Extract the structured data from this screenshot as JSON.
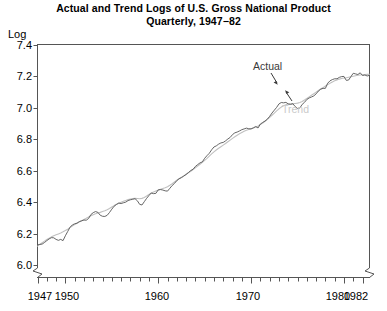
{
  "chart_data": {
    "type": "line",
    "title": "Actual and Trend Logs of U.S. Gross National Product",
    "subtitle": "Quarterly, 1947−82",
    "xlabel": "",
    "ylabel": "Log",
    "ylim": [
      6.0,
      7.4
    ],
    "xlim": [
      1947,
      1982.75
    ],
    "grid": false,
    "legend_position": "inline-annotations",
    "y_ticks": [
      "7.4",
      "7.2",
      "7.0",
      "6.8",
      "6.6",
      "6.4",
      "6.2",
      "6.0"
    ],
    "y_tick_values": [
      7.4,
      7.2,
      7.0,
      6.8,
      6.6,
      6.4,
      6.2,
      6.0
    ],
    "x_ticks_labeled": [
      "1947",
      "1950",
      "1960",
      "1970",
      "1980",
      "1982"
    ],
    "x_tick_values_labeled": [
      1947,
      1950,
      1960,
      1970,
      1980,
      1982
    ],
    "x_minor_tick_interval_years": 1,
    "axis_break_marks": [
      "x-axis-left-origin",
      "x-axis-right-end"
    ],
    "annotations": [
      {
        "text": "Actual",
        "x": 1972.2,
        "y": 7.24,
        "color": "#3a3a3a",
        "arrow_to": {
          "x": 1973.6,
          "y": 7.12
        }
      },
      {
        "text": "Trend",
        "x": 1975.0,
        "y": 6.93,
        "color": "#c9c9c9",
        "arrow_to": {
          "x": 1974.0,
          "y": 7.05
        }
      }
    ],
    "x": [
      1947.0,
      1947.25,
      1947.5,
      1947.75,
      1948.0,
      1948.25,
      1948.5,
      1948.75,
      1949.0,
      1949.25,
      1949.5,
      1949.75,
      1950.0,
      1950.25,
      1950.5,
      1950.75,
      1951.0,
      1951.25,
      1951.5,
      1951.75,
      1952.0,
      1952.25,
      1952.5,
      1952.75,
      1953.0,
      1953.25,
      1953.5,
      1953.75,
      1954.0,
      1954.25,
      1954.5,
      1954.75,
      1955.0,
      1955.25,
      1955.5,
      1955.75,
      1956.0,
      1956.25,
      1956.5,
      1956.75,
      1957.0,
      1957.25,
      1957.5,
      1957.75,
      1958.0,
      1958.25,
      1958.5,
      1958.75,
      1959.0,
      1959.25,
      1959.5,
      1959.75,
      1960.0,
      1960.25,
      1960.5,
      1960.75,
      1961.0,
      1961.25,
      1961.5,
      1961.75,
      1962.0,
      1962.25,
      1962.5,
      1962.75,
      1963.0,
      1963.25,
      1963.5,
      1963.75,
      1964.0,
      1964.25,
      1964.5,
      1964.75,
      1965.0,
      1965.25,
      1965.5,
      1965.75,
      1966.0,
      1966.25,
      1966.5,
      1966.75,
      1967.0,
      1967.25,
      1967.5,
      1967.75,
      1968.0,
      1968.25,
      1968.5,
      1968.75,
      1969.0,
      1969.25,
      1969.5,
      1969.75,
      1970.0,
      1970.25,
      1970.5,
      1970.75,
      1971.0,
      1971.25,
      1971.5,
      1971.75,
      1972.0,
      1972.25,
      1972.5,
      1972.75,
      1973.0,
      1973.25,
      1973.5,
      1973.75,
      1974.0,
      1974.25,
      1974.5,
      1974.75,
      1975.0,
      1975.25,
      1975.5,
      1975.75,
      1976.0,
      1976.25,
      1976.5,
      1976.75,
      1977.0,
      1977.25,
      1977.5,
      1977.75,
      1978.0,
      1978.25,
      1978.5,
      1978.75,
      1979.0,
      1979.25,
      1979.5,
      1979.75,
      1980.0,
      1980.25,
      1980.5,
      1980.75,
      1981.0,
      1981.25,
      1981.5,
      1981.75,
      1982.0,
      1982.25,
      1982.5,
      1982.75
    ],
    "series": [
      {
        "name": "Actual",
        "color": "#555555",
        "width": 0.9,
        "values": [
          6.128,
          6.131,
          6.133,
          6.143,
          6.155,
          6.166,
          6.174,
          6.173,
          6.163,
          6.157,
          6.163,
          6.155,
          6.186,
          6.213,
          6.24,
          6.255,
          6.262,
          6.266,
          6.276,
          6.281,
          6.286,
          6.285,
          6.296,
          6.321,
          6.333,
          6.34,
          6.335,
          6.317,
          6.31,
          6.309,
          6.316,
          6.334,
          6.355,
          6.374,
          6.385,
          6.394,
          6.391,
          6.396,
          6.4,
          6.41,
          6.415,
          6.418,
          6.422,
          6.409,
          6.386,
          6.382,
          6.403,
          6.424,
          6.442,
          6.458,
          6.454,
          6.456,
          6.478,
          6.48,
          6.477,
          6.472,
          6.47,
          6.488,
          6.506,
          6.519,
          6.537,
          6.549,
          6.556,
          6.566,
          6.576,
          6.588,
          6.601,
          6.609,
          6.627,
          6.639,
          6.65,
          6.656,
          6.679,
          6.696,
          6.711,
          6.733,
          6.751,
          6.758,
          6.769,
          6.777,
          6.78,
          6.79,
          6.802,
          6.812,
          6.83,
          6.841,
          6.846,
          6.853,
          6.861,
          6.866,
          6.871,
          6.867,
          6.866,
          6.873,
          6.881,
          6.872,
          6.897,
          6.907,
          6.916,
          6.928,
          6.946,
          6.967,
          6.985,
          7.003,
          7.025,
          7.034,
          7.032,
          7.035,
          7.025,
          7.022,
          7.026,
          7.008,
          6.996,
          6.999,
          7.022,
          7.035,
          7.053,
          7.063,
          7.069,
          7.076,
          7.089,
          7.107,
          7.119,
          7.124,
          7.124,
          7.157,
          7.172,
          7.18,
          7.185,
          7.185,
          7.194,
          7.199,
          7.2,
          7.175,
          7.177,
          7.199,
          7.22,
          7.216,
          7.212,
          7.223,
          7.206,
          7.209,
          7.203,
          7.207
        ]
      },
      {
        "name": "Trend",
        "color": "#c0c0c0",
        "width": 1.1,
        "values": [
          6.12,
          6.131,
          6.142,
          6.152,
          6.162,
          6.171,
          6.179,
          6.186,
          6.192,
          6.198,
          6.204,
          6.211,
          6.219,
          6.228,
          6.238,
          6.248,
          6.257,
          6.266,
          6.274,
          6.282,
          6.29,
          6.297,
          6.305,
          6.313,
          6.32,
          6.326,
          6.331,
          6.335,
          6.34,
          6.345,
          6.352,
          6.36,
          6.369,
          6.378,
          6.386,
          6.393,
          6.399,
          6.405,
          6.411,
          6.416,
          6.42,
          6.423,
          6.424,
          6.423,
          6.422,
          6.424,
          6.43,
          6.439,
          6.449,
          6.458,
          6.465,
          6.471,
          6.477,
          6.482,
          6.487,
          6.492,
          6.498,
          6.507,
          6.517,
          6.528,
          6.539,
          6.549,
          6.558,
          6.567,
          6.577,
          6.587,
          6.597,
          6.608,
          6.619,
          6.63,
          6.641,
          6.653,
          6.666,
          6.679,
          6.693,
          6.707,
          6.72,
          6.732,
          6.743,
          6.753,
          6.763,
          6.773,
          6.784,
          6.795,
          6.806,
          6.816,
          6.826,
          6.835,
          6.843,
          6.851,
          6.857,
          6.862,
          6.867,
          6.872,
          6.878,
          6.885,
          6.894,
          6.904,
          6.915,
          6.927,
          6.94,
          6.953,
          6.967,
          6.981,
          6.994,
          7.005,
          7.014,
          7.02,
          7.024,
          7.026,
          7.027,
          7.028,
          7.03,
          7.034,
          7.041,
          7.05,
          7.06,
          7.07,
          7.08,
          7.09,
          7.1,
          7.11,
          7.12,
          7.129,
          7.139,
          7.148,
          7.157,
          7.165,
          7.172,
          7.178,
          7.183,
          7.187,
          7.19,
          7.192,
          7.195,
          7.198,
          7.201,
          7.204,
          7.207,
          7.209,
          7.211,
          7.212,
          7.213,
          7.214
        ]
      }
    ]
  },
  "labels": {
    "axis_unit": "Log",
    "actual": "Actual",
    "trend": "Trend"
  },
  "colors": {
    "actual_line": "#555555",
    "trend_line": "#c0c0c0",
    "actual_label": "#3a3a3a",
    "trend_label": "#c9c9c9",
    "axis": "#555555",
    "text": "#000000"
  }
}
